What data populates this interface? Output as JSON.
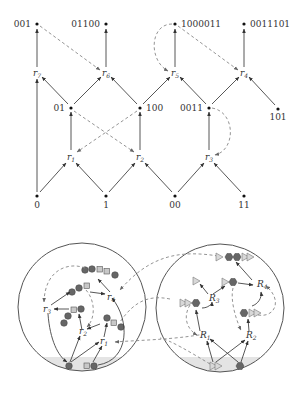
{
  "top_graph": {
    "leaf_nodes_top": [
      {
        "id": "n001",
        "label": "001",
        "x": 37,
        "y": 24
      },
      {
        "id": "n01100",
        "label": "01100",
        "x": 106,
        "y": 24
      },
      {
        "id": "n1000011",
        "label": "1000011",
        "x": 175,
        "y": 24
      },
      {
        "id": "n0011101",
        "label": "0011101",
        "x": 244,
        "y": 24
      }
    ],
    "rule_nodes_upper": [
      {
        "id": "r7",
        "label": "r",
        "sub": "7",
        "x": 37,
        "y": 73
      },
      {
        "id": "r6",
        "label": "r",
        "sub": "6",
        "x": 106,
        "y": 73
      },
      {
        "id": "r5",
        "label": "r",
        "sub": "5",
        "x": 175,
        "y": 73
      },
      {
        "id": "r4",
        "label": "r",
        "sub": "4",
        "x": 244,
        "y": 73
      }
    ],
    "middle_nodes": [
      {
        "id": "n01",
        "label": "01",
        "x": 71,
        "y": 108
      },
      {
        "id": "n100",
        "label": "100",
        "x": 140,
        "y": 108
      },
      {
        "id": "n0011",
        "label": "0011",
        "x": 209,
        "y": 108
      },
      {
        "id": "n101",
        "label": "101",
        "x": 278,
        "y": 109
      }
    ],
    "rule_nodes_lower": [
      {
        "id": "r1",
        "label": "r",
        "sub": "1",
        "x": 71,
        "y": 157
      },
      {
        "id": "r2",
        "label": "r",
        "sub": "2",
        "x": 140,
        "y": 157
      },
      {
        "id": "r3",
        "label": "r",
        "sub": "3",
        "x": 209,
        "y": 157
      }
    ],
    "base_nodes": [
      {
        "id": "n0",
        "label": "0",
        "x": 37,
        "y": 196
      },
      {
        "id": "n1",
        "label": "1",
        "x": 106,
        "y": 196
      },
      {
        "id": "n00",
        "label": "00",
        "x": 175,
        "y": 196
      },
      {
        "id": "n11",
        "label": "11",
        "x": 244,
        "y": 196
      }
    ],
    "solid_edges": [
      [
        "n0",
        "r1"
      ],
      [
        "n1",
        "r1"
      ],
      [
        "n1",
        "r2"
      ],
      [
        "n00",
        "r2"
      ],
      [
        "n00",
        "r3"
      ],
      [
        "n11",
        "r3"
      ],
      [
        "r1",
        "n01"
      ],
      [
        "r2",
        "n100"
      ],
      [
        "r3",
        "n0011"
      ],
      [
        "n0",
        "r7"
      ],
      [
        "n01",
        "r7"
      ],
      [
        "n01",
        "r6"
      ],
      [
        "n100",
        "r6"
      ],
      [
        "n100",
        "r5"
      ],
      [
        "n0011",
        "r5"
      ],
      [
        "n0011",
        "r4"
      ],
      [
        "n101",
        "r4"
      ],
      [
        "r7",
        "n001"
      ],
      [
        "r6",
        "n01100"
      ],
      [
        "r5",
        "n1000011"
      ],
      [
        "r4",
        "n0011101"
      ]
    ],
    "dashed_edges": [
      [
        "n01",
        "r2"
      ],
      [
        "n100",
        "r1"
      ],
      [
        "n0011",
        "r3"
      ],
      [
        "n001",
        "r6"
      ],
      [
        "n1000011",
        "r5"
      ],
      [
        "n1000011",
        "r4"
      ]
    ]
  },
  "bottom_graph": {
    "left_circle": {
      "rule_labels": [
        {
          "id": "r1",
          "label": "r",
          "sub": "1"
        },
        {
          "id": "r2",
          "label": "r",
          "sub": "2"
        },
        {
          "id": "r3",
          "label": "r",
          "sub": "3"
        },
        {
          "id": "r4",
          "label": "r",
          "sub": "4"
        }
      ]
    },
    "right_circle": {
      "rule_labels": [
        {
          "id": "R1",
          "label": "R",
          "sub": "1"
        },
        {
          "id": "R2",
          "label": "R",
          "sub": "2"
        },
        {
          "id": "R3",
          "label": "R",
          "sub": "3"
        },
        {
          "id": "R4",
          "label": "R",
          "sub": "4"
        }
      ]
    }
  }
}
